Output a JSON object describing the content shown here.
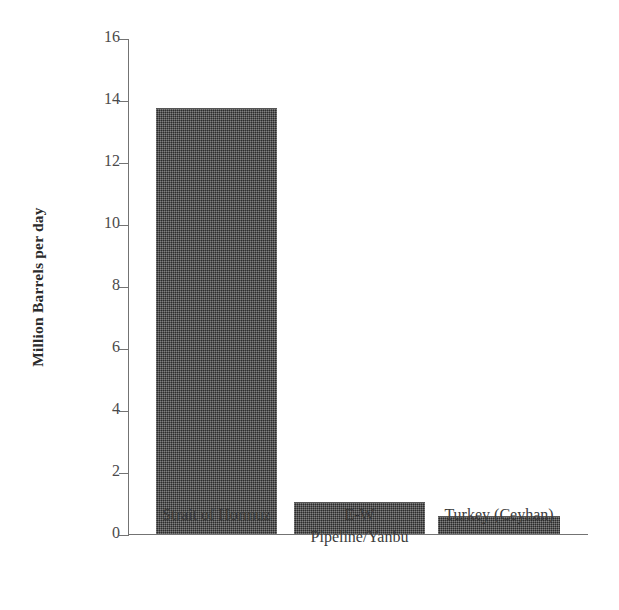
{
  "chart_data": {
    "type": "bar",
    "title": "",
    "xlabel": "",
    "ylabel": "Million Barrels per day",
    "categories": [
      "Strait of Hormuz",
      "E-W Pipeline/Yanbu",
      "Turkey (Ceyhan)"
    ],
    "category_lines": [
      [
        "Strait of Hormuz"
      ],
      [
        "E-W",
        "Pipeline/Yanbu"
      ],
      [
        "Turkey (Ceyhan)"
      ]
    ],
    "values": [
      13.7,
      1.0,
      0.55
    ],
    "ylim": [
      0,
      16
    ],
    "ytick_step": 2,
    "ytick_labels": [
      "0",
      "2",
      "4",
      "6",
      "8",
      "10",
      "12",
      "14",
      "16"
    ],
    "ytick_values": [
      0,
      2,
      4,
      6,
      8,
      10,
      12,
      14,
      16
    ],
    "grid": false,
    "legend": null,
    "legend_position": "none",
    "bar_color": "#3d3d3d",
    "axis_color": "#737373",
    "background_color": "#ffffff"
  }
}
